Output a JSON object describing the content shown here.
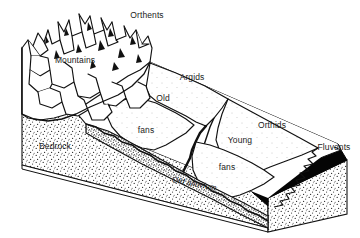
{
  "figure": {
    "type": "geologic-block-diagram",
    "title": "",
    "style": {
      "ink": "#111111",
      "paper": "#ffffff",
      "stipple": "#2b2b2b",
      "dark_band": "#000000"
    }
  },
  "labels": [
    {
      "id": "orthents",
      "text": "Orthents",
      "x": 147,
      "y": 16,
      "anchor": "middle",
      "kind": "soil-order",
      "italic": false,
      "rotated": false
    },
    {
      "id": "mountains",
      "text": "Mountains",
      "x": 75,
      "y": 61,
      "anchor": "middle",
      "kind": "landform",
      "italic": false,
      "rotated": false
    },
    {
      "id": "argids",
      "text": "Argids",
      "x": 192,
      "y": 78,
      "anchor": "middle",
      "kind": "soil-order",
      "italic": false,
      "rotated": false
    },
    {
      "id": "old",
      "text": "Old",
      "x": 163,
      "y": 99,
      "anchor": "middle",
      "kind": "landform",
      "italic": false,
      "rotated": false
    },
    {
      "id": "orthids",
      "text": "Orthids",
      "x": 272,
      "y": 126,
      "anchor": "middle",
      "kind": "soil-order",
      "italic": false,
      "rotated": false
    },
    {
      "id": "fans-upper",
      "text": "fans",
      "x": 146,
      "y": 131,
      "anchor": "middle",
      "kind": "landform",
      "italic": false,
      "rotated": false
    },
    {
      "id": "young",
      "text": "Young",
      "x": 240,
      "y": 141,
      "anchor": "middle",
      "kind": "landform",
      "italic": false,
      "rotated": false
    },
    {
      "id": "bedrock",
      "text": "Bedrock",
      "x": 55,
      "y": 147,
      "anchor": "middle",
      "kind": "substrate",
      "italic": false,
      "rotated": false
    },
    {
      "id": "fluvents",
      "text": "Fluvents",
      "x": 334,
      "y": 148,
      "anchor": "middle",
      "kind": "soil-order",
      "italic": false,
      "rotated": false
    },
    {
      "id": "fans-lower",
      "text": "fans",
      "x": 227,
      "y": 168,
      "anchor": "middle",
      "kind": "landform",
      "italic": false,
      "rotated": false
    },
    {
      "id": "old-alluvium",
      "text": "Old alluvium",
      "x": 172,
      "y": 178,
      "anchor": "start",
      "kind": "substrate",
      "italic": true,
      "rotated": true
    }
  ],
  "legend_text": {
    "soil_orders": [
      "Orthents",
      "Argids",
      "Orthids",
      "Fluvents"
    ],
    "landforms": [
      "Mountains",
      "Old fans",
      "Young fans"
    ],
    "substrates": [
      "Bedrock",
      "Old alluvium"
    ]
  }
}
